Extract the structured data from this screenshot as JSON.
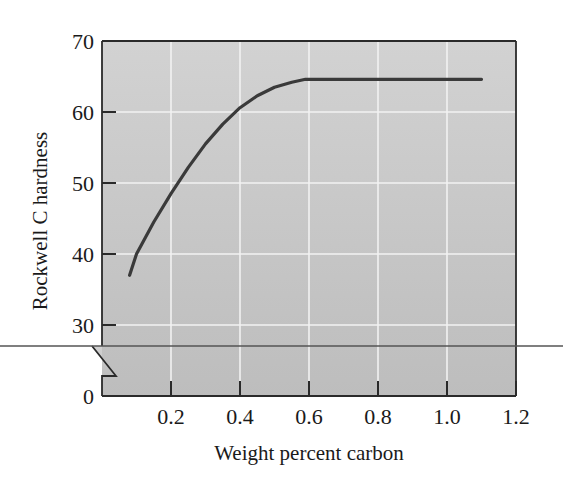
{
  "chart_data": {
    "type": "line",
    "title": "",
    "xlabel": "Weight percent carbon",
    "ylabel": "Rockwell C hardness",
    "xlim": [
      0,
      1.2
    ],
    "ylim": [
      0,
      70
    ],
    "y_axis_break": true,
    "y_axis_break_range": [
      0,
      27
    ],
    "grid": true,
    "legend": null,
    "x_ticks": [
      0.2,
      0.4,
      0.6,
      0.8,
      1.0,
      1.2
    ],
    "x_tick_labels": [
      "0.2",
      "0.4",
      "0.6",
      "0.8",
      "1.0",
      "1.2"
    ],
    "y_ticks": [
      0,
      30,
      40,
      50,
      60,
      70
    ],
    "y_tick_labels": [
      "0",
      "30",
      "40",
      "50",
      "60",
      "70"
    ],
    "series": [
      {
        "name": "Hardness vs carbon",
        "x": [
          0.08,
          0.1,
          0.15,
          0.2,
          0.25,
          0.3,
          0.35,
          0.4,
          0.45,
          0.5,
          0.55,
          0.59,
          0.7,
          0.8,
          0.9,
          1.0,
          1.1
        ],
        "y": [
          37.0,
          40.0,
          44.5,
          48.5,
          52.2,
          55.5,
          58.3,
          60.6,
          62.3,
          63.5,
          64.2,
          64.6,
          64.6,
          64.6,
          64.6,
          64.6,
          64.6
        ]
      }
    ]
  },
  "colors": {
    "plot_background": "#c4c4c4",
    "grid": "#f2f2f2",
    "line": "#3a3a3a",
    "axis": "#2a2a2a",
    "cut_line": "#555555"
  }
}
